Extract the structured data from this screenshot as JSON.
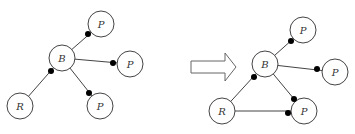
{
  "diagram": {
    "before": {
      "nodes": [
        {
          "id": "B",
          "label": "B",
          "cx": 62,
          "cy": 58
        },
        {
          "id": "P1",
          "label": "P",
          "cx": 101,
          "cy": 24
        },
        {
          "id": "P2",
          "label": "P",
          "cx": 130,
          "cy": 64
        },
        {
          "id": "P3",
          "label": "P",
          "cx": 100,
          "cy": 106
        },
        {
          "id": "R",
          "label": "R",
          "cx": 20,
          "cy": 106
        }
      ],
      "edges": [
        {
          "from": "B",
          "to": "P1",
          "dot": [
            88,
            34
          ]
        },
        {
          "from": "B",
          "to": "P2",
          "dot": [
            113,
            63
          ]
        },
        {
          "from": "B",
          "to": "P3",
          "dot": [
            89,
            93
          ]
        },
        {
          "from": "R",
          "to": "B",
          "dot": [
            51,
            71
          ]
        }
      ]
    },
    "transition_arrow": {
      "direction": "right"
    },
    "after": {
      "nodes": [
        {
          "id": "B",
          "label": "B",
          "cx": 265,
          "cy": 64
        },
        {
          "id": "P1",
          "label": "P",
          "cx": 303,
          "cy": 30
        },
        {
          "id": "P2",
          "label": "P",
          "cx": 335,
          "cy": 72
        },
        {
          "id": "P3",
          "label": "P",
          "cx": 304,
          "cy": 111
        },
        {
          "id": "R",
          "label": "R",
          "cx": 222,
          "cy": 111
        }
      ],
      "edges": [
        {
          "from": "B",
          "to": "P1",
          "dot": [
            291,
            41
          ]
        },
        {
          "from": "B",
          "to": "P2",
          "dot": [
            317,
            69
          ]
        },
        {
          "from": "B",
          "to": "P3",
          "dot": [
            294,
            99
          ]
        },
        {
          "from": "R",
          "to": "B",
          "dot": [
            254,
            77
          ]
        },
        {
          "from": "R",
          "to": "P3",
          "dot": [
            288,
            113
          ]
        }
      ]
    }
  }
}
